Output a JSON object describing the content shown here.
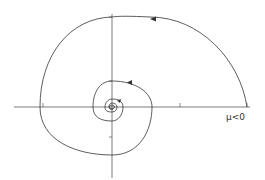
{
  "figure": {
    "type": "phase-portrait-spiral",
    "parameter_label": "μ<0",
    "axes": {
      "horizontal": {
        "x1": 14,
        "y": 107,
        "x2": 250
      },
      "vertical": {
        "x": 112,
        "y1": 14,
        "y2": 178
      }
    },
    "x_ticks": [
      {
        "x": 43,
        "label": "-1.0"
      },
      {
        "x": 180,
        "label": "1.0"
      },
      {
        "x": 247,
        "label": "1.5"
      }
    ],
    "y_ticks": [
      {
        "y": 17,
        "label": "1"
      },
      {
        "y": 81,
        "label": ".5"
      },
      {
        "y": 137,
        "label": "-.5"
      }
    ],
    "colors": {
      "line": "#333333",
      "background": "#ffffff"
    }
  }
}
